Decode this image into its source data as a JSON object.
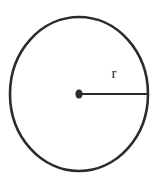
{
  "figure": {
    "background_color": "#ffffff",
    "stroke_color": "#2b2b2b",
    "label_color": "#262626"
  },
  "labels": {
    "radius": "r"
  },
  "geometry": {
    "circle": {
      "center_x": 79,
      "center_y": 94,
      "radius_x": 69,
      "radius_y": 77,
      "stroke_width": 2.6
    },
    "center_dot": {
      "x": 79,
      "y": 94,
      "radius_x": 3.6,
      "radius_y": 4.6
    },
    "radius_line": {
      "x1": 79,
      "y1": 94,
      "x2": 148,
      "y2": 94,
      "stroke_width": 2.2
    }
  }
}
